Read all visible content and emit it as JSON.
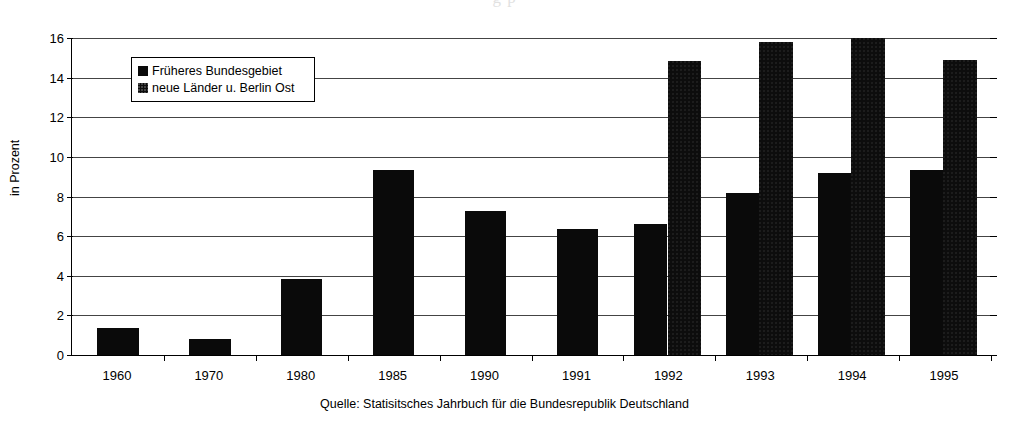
{
  "page": {
    "top_cropped_text": "g                                   p"
  },
  "legend": {
    "items": [
      {
        "label": "Früheres Bundesgebiet",
        "swatch": "solid-black-square-icon"
      },
      {
        "label": "neue Länder u. Berlin Ost",
        "swatch": "dotted-black-square-icon"
      }
    ]
  },
  "source": {
    "text": "Quelle: Statisitsches Jahrbuch für die Bundesrepublik Deutschland"
  },
  "chart_data": {
    "type": "bar",
    "title": "",
    "xlabel": "",
    "ylabel": "in Prozent",
    "ylim": [
      0,
      16
    ],
    "ytick_step": 2,
    "yticks": [
      0,
      2,
      4,
      6,
      8,
      10,
      12,
      14,
      16
    ],
    "ytick_labels": [
      "0",
      "2",
      "4",
      "6",
      "8",
      "10",
      "12",
      "14",
      "16"
    ],
    "grid": true,
    "grid_axis": "y",
    "legend_position": "upper-left-inside",
    "categories": [
      "1960",
      "1970",
      "1980",
      "1985",
      "1990",
      "1991",
      "1992",
      "1993",
      "1994",
      "1995"
    ],
    "series": [
      {
        "name": "Früheres Bundesgebiet",
        "values": [
          1.35,
          0.8,
          3.85,
          9.35,
          7.25,
          6.35,
          6.6,
          8.2,
          9.2,
          9.35
        ]
      },
      {
        "name": "neue Länder u. Berlin Ost",
        "values": [
          null,
          null,
          null,
          null,
          null,
          null,
          14.85,
          15.8,
          16.0,
          14.9
        ]
      }
    ]
  }
}
